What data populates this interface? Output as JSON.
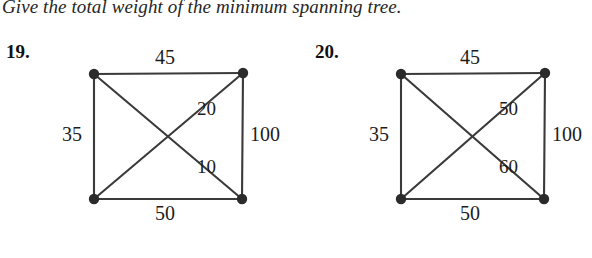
{
  "instruction": "Give the total weight of the minimum spanning tree.",
  "problems": [
    {
      "number": "19.",
      "nodes": [
        {
          "name": "top-left",
          "x": 94,
          "y": 74
        },
        {
          "name": "top-right",
          "x": 243,
          "y": 73
        },
        {
          "name": "bottom-left",
          "x": 94,
          "y": 199
        },
        {
          "name": "bottom-right",
          "x": 242,
          "y": 199
        }
      ],
      "edges": [
        {
          "name": "top",
          "from": "top-left",
          "to": "top-right",
          "weight": "45"
        },
        {
          "name": "left",
          "from": "top-left",
          "to": "bottom-left",
          "weight": "35"
        },
        {
          "name": "right",
          "from": "top-right",
          "to": "bottom-right",
          "weight": "100"
        },
        {
          "name": "bottom",
          "from": "bottom-left",
          "to": "bottom-right",
          "weight": "50"
        },
        {
          "name": "diagonal-up",
          "from": "bottom-left",
          "to": "top-right",
          "weight": "20"
        },
        {
          "name": "diagonal-down",
          "from": "top-left",
          "to": "bottom-right",
          "weight": "10"
        }
      ],
      "labels": {
        "top": "45",
        "left": "35",
        "right": "100",
        "bottom": "50",
        "diagonal_up": "20",
        "diagonal_down": "10"
      }
    },
    {
      "number": "20.",
      "nodes": [
        {
          "name": "top-left",
          "x": 101,
          "y": 74
        },
        {
          "name": "top-right",
          "x": 245,
          "y": 73
        },
        {
          "name": "bottom-left",
          "x": 101,
          "y": 199
        },
        {
          "name": "bottom-right",
          "x": 244,
          "y": 199
        }
      ],
      "edges": [
        {
          "name": "top",
          "from": "top-left",
          "to": "top-right",
          "weight": "45"
        },
        {
          "name": "left",
          "from": "top-left",
          "to": "bottom-left",
          "weight": "35"
        },
        {
          "name": "right",
          "from": "top-right",
          "to": "bottom-right",
          "weight": "100"
        },
        {
          "name": "bottom",
          "from": "bottom-left",
          "to": "bottom-right",
          "weight": "50"
        },
        {
          "name": "diagonal-up",
          "from": "bottom-left",
          "to": "top-right",
          "weight": "50"
        },
        {
          "name": "diagonal-down",
          "from": "top-left",
          "to": "bottom-right",
          "weight": "60"
        }
      ],
      "labels": {
        "top": "45",
        "left": "35",
        "right": "100",
        "bottom": "50",
        "diagonal_up": "50",
        "diagonal_down": "60"
      }
    }
  ],
  "style": {
    "ink": "#1a1a1a",
    "edge_color": "#3a3a3a",
    "node_color": "#2b2b2b",
    "background": "#ffffff"
  }
}
